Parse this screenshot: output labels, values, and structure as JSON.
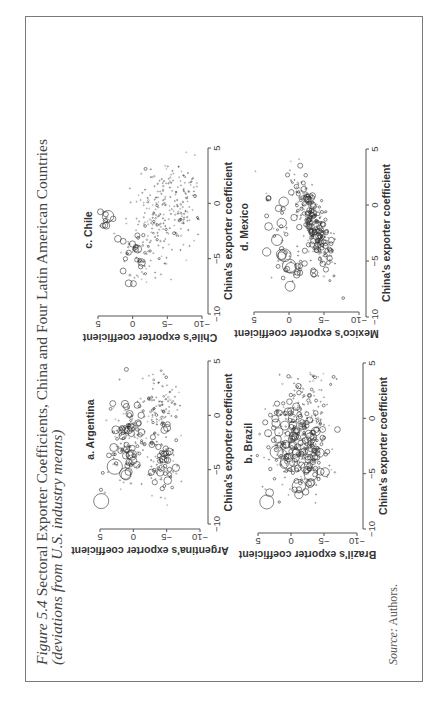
{
  "figure": {
    "number": "Figure 5.4",
    "title": "Sectoral Exporter Coefficients, China and Four Latin American Countries",
    "subtitle": "(deviations from U.S. industry means)",
    "source_label": "Source:",
    "source_text": "Authors."
  },
  "chart_data": [
    {
      "type": "scatter",
      "panel_label": "a. Argentina",
      "xlabel": "China's exporter coefficient",
      "ylabel": "Argentina's exporter coefficient",
      "xlim": [
        -10,
        5
      ],
      "ylim": [
        -10,
        5
      ],
      "xticks": [
        -10,
        -5,
        0,
        5
      ],
      "yticks": [
        -10,
        -5,
        0,
        5
      ],
      "marker": "hollow circles sized by sector weight",
      "clusters": [
        {
          "cx": -2.0,
          "cy": 0.5,
          "sx": 1.6,
          "sy": 1.4,
          "n": 120,
          "rmax": 4
        },
        {
          "cx": -4.0,
          "cy": -4.5,
          "sx": 1.5,
          "sy": 1.0,
          "n": 90,
          "rmax": 4
        },
        {
          "cx": 0.5,
          "cy": -4.0,
          "sx": 1.8,
          "sy": 1.5,
          "n": 110,
          "rmax": 1.5
        },
        {
          "cx": -5.0,
          "cy": 1.5,
          "sx": 1.5,
          "sy": 2.0,
          "n": 25,
          "rmax": 9
        }
      ]
    },
    {
      "type": "scatter",
      "panel_label": "b. Brazil",
      "xlabel": "China's exporter coefficient",
      "ylabel": "Brazil's exporter coefficient",
      "xlim": [
        -10,
        5
      ],
      "ylim": [
        -10,
        5
      ],
      "xticks": [
        -10,
        -5,
        0,
        5
      ],
      "yticks": [
        -10,
        -5,
        0,
        5
      ],
      "marker": "hollow circles sized by sector weight",
      "clusters": [
        {
          "cx": -1.5,
          "cy": 0.0,
          "sx": 2.0,
          "sy": 1.8,
          "n": 160,
          "rmax": 4.5
        },
        {
          "cx": -3.5,
          "cy": -3.0,
          "sx": 1.6,
          "sy": 1.5,
          "n": 140,
          "rmax": 4.5
        },
        {
          "cx": 1.0,
          "cy": -3.0,
          "sx": 1.8,
          "sy": 1.6,
          "n": 90,
          "rmax": 2
        },
        {
          "cx": -5.5,
          "cy": 1.0,
          "sx": 1.4,
          "sy": 2.0,
          "n": 25,
          "rmax": 8
        }
      ]
    },
    {
      "type": "scatter",
      "panel_label": "c. Chile",
      "xlabel": "China's exporter coefficient",
      "ylabel": "Chile's exporter coefficient",
      "xlim": [
        -10,
        5
      ],
      "ylim": [
        -10,
        5
      ],
      "xticks": [
        -10,
        -5,
        0,
        5
      ],
      "yticks": [
        -10,
        -5,
        0,
        5
      ],
      "marker": "hollow circles sized by sector weight",
      "clusters": [
        {
          "cx": -1.5,
          "cy": 3.8,
          "sx": 0.5,
          "sy": 0.6,
          "n": 14,
          "rmax": 8
        },
        {
          "cx": -4.5,
          "cy": -0.5,
          "sx": 1.4,
          "sy": 1.2,
          "n": 45,
          "rmax": 4
        },
        {
          "cx": -2.0,
          "cy": -3.0,
          "sx": 2.2,
          "sy": 2.0,
          "n": 120,
          "rmax": 1.5
        },
        {
          "cx": 0.5,
          "cy": -6.5,
          "sx": 2.2,
          "sy": 2.0,
          "n": 160,
          "rmax": 0.8
        }
      ]
    },
    {
      "type": "scatter",
      "panel_label": "d. Mexico",
      "xlabel": "China's exporter coefficient",
      "ylabel": "Mexico's exporter coefficient",
      "xlim": [
        -10,
        5
      ],
      "ylim": [
        -10,
        5
      ],
      "xticks": [
        -10,
        -5,
        0,
        5
      ],
      "yticks": [
        -10,
        -5,
        0,
        5
      ],
      "marker": "hollow circles sized by sector weight",
      "clusters": [
        {
          "cx": -1.5,
          "cy": -3.5,
          "sx": 2.0,
          "sy": 0.8,
          "slope": 0.55,
          "n": 320,
          "rmax": 3
        },
        {
          "cx": -5.5,
          "cy": -0.5,
          "sx": 1.0,
          "sy": 1.6,
          "n": 40,
          "rmax": 7
        },
        {
          "cx": -1.5,
          "cy": 1.5,
          "sx": 1.5,
          "sy": 1.2,
          "n": 25,
          "rmax": 6
        },
        {
          "cx": 3.0,
          "cy": 5.0,
          "sx": 0.1,
          "sy": 0.1,
          "n": 1,
          "rmax": 8
        }
      ]
    }
  ]
}
